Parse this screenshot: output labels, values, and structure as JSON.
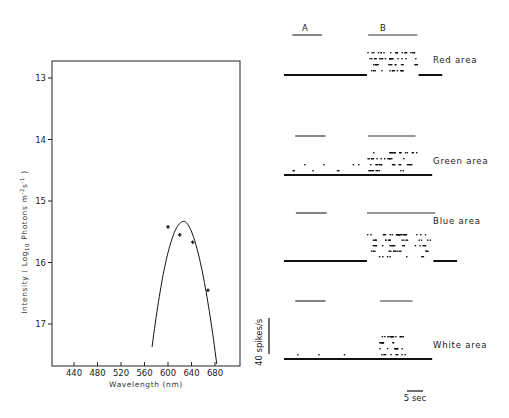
{
  "chart_data": [
    {
      "type": "line",
      "panel": "spectral-sensitivity",
      "title": "",
      "xlabel": "Wavelength (nm)",
      "ylabel": "Intensity ( Log10 Photons m-2 s-1 )",
      "ylabel_parts": {
        "main": "Intensity ( Log",
        "sub": "10",
        "mid": "  Photons  m",
        "sup1": "-2",
        "s": "s",
        "sup2": "-1",
        "end": " )"
      },
      "x_ticks": [
        440,
        480,
        520,
        560,
        600,
        640,
        680
      ],
      "y_ticks": [
        13,
        14,
        15,
        16,
        17
      ],
      "xlim": [
        385,
        725
      ],
      "ylim_inverted": [
        12.7,
        17.7
      ],
      "grid": false,
      "points": [
        {
          "x": 600,
          "y": 15.42
        },
        {
          "x": 620,
          "y": 15.55
        },
        {
          "x": 642,
          "y": 15.67
        },
        {
          "x": 668,
          "y": 16.45
        }
      ],
      "fit_curve": {
        "peak": {
          "x": 627,
          "y": 15.33
        },
        "start": {
          "x": 573,
          "y": 17.37
        },
        "end": {
          "x": 683,
          "y": 17.65
        }
      }
    },
    {
      "type": "scatter",
      "panel": "spike-rasters",
      "stimulus_labels": {
        "A": "A",
        "B": "B"
      },
      "scale_bars": {
        "vertical": "40 spikes/s",
        "horizontal": "5 sec"
      },
      "time_window_s": [
        0,
        27
      ],
      "rows": [
        {
          "label": "Red area",
          "stim_A_s": [
            1.4,
            6.4
          ],
          "stim_B_s": [
            14.2,
            22.5
          ],
          "baseline_rate": 0,
          "response_rate_levels": [
            8,
            12,
            18,
            22
          ],
          "response_window_s": [
            14.0,
            22.5
          ]
        },
        {
          "label": "Green area",
          "stim_A_s": [
            1.9,
            7.0
          ],
          "stim_B_s": [
            14.2,
            22.2
          ],
          "baseline_rate": 3,
          "response_rate_levels": [
            4,
            9,
            14,
            20
          ],
          "response_window_s": [
            14.0,
            22.5
          ]
        },
        {
          "label": "Blue area",
          "stim_A_s": [
            2.0,
            7.2
          ],
          "stim_B_s": [
            14.0,
            25.5
          ],
          "baseline_rate": 0,
          "response_rate_levels": [
            4,
            9,
            13,
            18,
            23
          ],
          "response_window_s": [
            14.0,
            25.0
          ]
        },
        {
          "label": "White area",
          "stim_A_s": [
            1.9,
            7.0
          ],
          "stim_B_s": [
            16.2,
            21.7
          ],
          "baseline_rate": 1,
          "response_rate_levels": [
            3,
            6,
            10,
            13
          ],
          "response_window_s": [
            16.0,
            20.5
          ]
        }
      ]
    }
  ]
}
